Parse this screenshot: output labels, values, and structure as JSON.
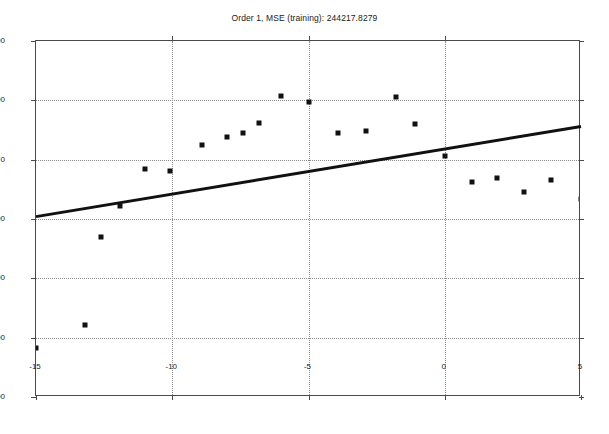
{
  "chart_data": {
    "type": "scatter",
    "title": "Order 1, MSE (training): 244217.8279",
    "xlabel": "",
    "ylabel": "",
    "xlim": [
      -15,
      5
    ],
    "ylim": [
      -2000,
      1000
    ],
    "grid": true,
    "legend": null,
    "xticks": [
      -15,
      -10,
      -5,
      0,
      5
    ],
    "xticklabels": [
      "-15",
      "-10",
      "-5",
      "0",
      "5"
    ],
    "yticks": [
      -2000,
      -1500,
      -1000,
      -500,
      0,
      500,
      1000
    ],
    "yticklabels": [
      "-2000",
      "-1500",
      "-1000",
      "-500",
      "0",
      "500",
      "1000"
    ],
    "series": [
      {
        "name": "training data",
        "type": "scatter",
        "marker": "square",
        "color": "#111111",
        "points": [
          {
            "x": -15.0,
            "y": -1585
          },
          {
            "x": -13.2,
            "y": -1390
          },
          {
            "x": -12.6,
            "y": -650
          },
          {
            "x": -11.9,
            "y": -390
          },
          {
            "x": -11.0,
            "y": -80
          },
          {
            "x": -10.1,
            "y": -95
          },
          {
            "x": -8.9,
            "y": 125
          },
          {
            "x": -8.0,
            "y": 195
          },
          {
            "x": -7.4,
            "y": 225
          },
          {
            "x": -6.8,
            "y": 305
          },
          {
            "x": -6.0,
            "y": 535
          },
          {
            "x": -5.0,
            "y": 485
          },
          {
            "x": -3.9,
            "y": 225
          },
          {
            "x": -2.9,
            "y": 245
          },
          {
            "x": -1.8,
            "y": 525
          },
          {
            "x": -1.1,
            "y": 300
          },
          {
            "x": 0.0,
            "y": 35
          },
          {
            "x": 1.0,
            "y": -185
          },
          {
            "x": 1.9,
            "y": -155
          },
          {
            "x": 2.9,
            "y": -275
          },
          {
            "x": 3.9,
            "y": -175
          },
          {
            "x": 5.0,
            "y": -330
          }
        ]
      },
      {
        "name": "order-1 polynomial fit",
        "type": "line",
        "color": "#111111",
        "linewidth": 3,
        "endpoints": [
          {
            "x": -15.0,
            "y": -480
          },
          {
            "x": 5.0,
            "y": 280
          }
        ]
      }
    ]
  },
  "axes": {
    "frame_color": "#4a4a4a",
    "grid_color": "#8c8c8c",
    "background": "#ffffff"
  }
}
